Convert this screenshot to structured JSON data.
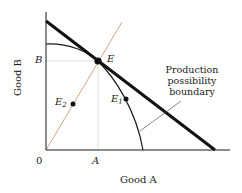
{
  "diagram": {
    "type": "production possibility frontier",
    "axes": {
      "x_label": "Good A",
      "y_label": "Good B",
      "origin_label": "0"
    },
    "ticks": {
      "x_tick": "A",
      "y_tick": "B"
    },
    "points": {
      "E": {
        "label": "E",
        "sub": ""
      },
      "E1": {
        "label": "E",
        "sub": "1"
      },
      "E2": {
        "label": "E",
        "sub": "2"
      }
    },
    "annotation": {
      "line1": "Production",
      "line2": "possibility",
      "line3": "boundary"
    },
    "colors": {
      "ink": "#1a1a1a",
      "ray": "#d4a48a",
      "guide": "#d9d4cc"
    }
  }
}
